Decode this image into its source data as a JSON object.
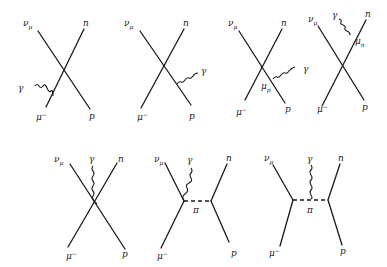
{
  "figure": {
    "type": "feynman-diagrams",
    "process": "muon neutrino + muon capture with photon emission (radiative)",
    "ink_color": "#1a1a1a",
    "background": "#ffffff"
  },
  "labels": {
    "nu_mu": "ν",
    "nu_sub": "μ",
    "neutron": "n",
    "proton": "p",
    "muon": "μ",
    "muon_sup": "−",
    "photon": "γ",
    "pion": "π",
    "mu_p": "μ",
    "mu_p_sub": "p",
    "mu_n": "μ",
    "mu_n_sub": "n"
  },
  "diagrams": [
    {
      "id": 1,
      "description": "photon emitted from muon leg",
      "photon_from": "μ⁻"
    },
    {
      "id": 2,
      "description": "photon emitted from proton leg",
      "photon_from": "p"
    },
    {
      "id": 3,
      "description": "photon emitted from proton magnetic moment",
      "photon_from": "p",
      "vertex_label": "μp"
    },
    {
      "id": 4,
      "description": "photon emitted from neutron magnetic moment",
      "photon_from": "n",
      "vertex_label": "μn"
    },
    {
      "id": 5,
      "description": "photon emitted from contact vertex",
      "photon_from": "vertex"
    },
    {
      "id": 6,
      "description": "pion exchange, photon from lepton-pion vertex",
      "photon_from": "vertex",
      "exchange": "π"
    },
    {
      "id": 7,
      "description": "pion exchange, photon from pion propagator",
      "photon_from": "π",
      "exchange": "π"
    }
  ]
}
